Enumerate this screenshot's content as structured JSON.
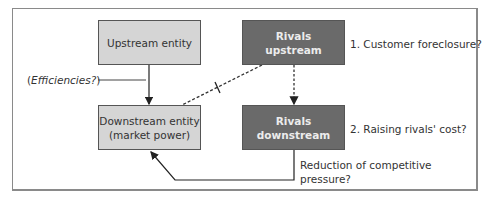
{
  "diagram": {
    "boxes": {
      "upstream_entity": "Upstream entity",
      "rivals_upstream_line1": "Rivals",
      "rivals_upstream_line2": "upstream",
      "downstream_entity_line1": "Downstream entity",
      "downstream_entity_line2": "(market power)",
      "rivals_downstream_line1": "Rivals",
      "rivals_downstream_line2": "downstream"
    },
    "labels": {
      "efficiencies_open": "(",
      "efficiencies_text": "Efficiencies?",
      "efficiencies_close": ")",
      "customer_foreclosure": "1. Customer foreclosure?",
      "raising_rivals_cost": "2. Raising rivals' cost?",
      "reduction_line1": "Reduction of competitive",
      "reduction_line2": "pressure?"
    },
    "colors": {
      "light_box": "#d5d5d5",
      "dark_box": "#6a6a6a",
      "line": "#333333"
    }
  }
}
